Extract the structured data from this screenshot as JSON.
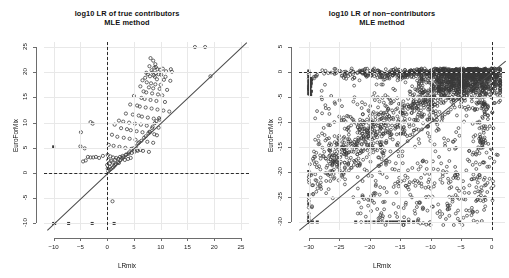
{
  "figure": {
    "background": "#ffffff",
    "point_color": "#3a3a3a",
    "line_color": "#4a4a4a",
    "ref_color": "#2b2b2b"
  },
  "panels": [
    {
      "id": "true-contributors",
      "title_line1": "log10 LR of true contributors",
      "title_line2": "MLE method",
      "xlabel": "LRmix",
      "ylabel": "EuroForMix",
      "xticks": [
        -10,
        -5,
        0,
        5,
        10,
        15,
        20,
        25
      ],
      "yticks": [
        -10,
        -5,
        0,
        5,
        10,
        15,
        20,
        25
      ],
      "xlim": [
        -11.8,
        26.5
      ],
      "ylim": [
        -11.3,
        26.0
      ],
      "hline": 0,
      "vline": 0,
      "identity_line": true
    },
    {
      "id": "non-contributors",
      "title_line1": "log10 LR of non−contributors",
      "title_line2": "MLE method",
      "xlabel": "LRmix",
      "ylabel": "EuroForMix",
      "xticks": [
        -30,
        -25,
        -20,
        -15,
        -10,
        -5,
        0
      ],
      "yticks": [
        -30,
        -25,
        -20,
        -15,
        -10,
        -5,
        0,
        5
      ],
      "xlim": [
        -31.6,
        2.2
      ],
      "ylim": [
        -31.6,
        6.0
      ],
      "hline": 0,
      "vline": 0,
      "identity_line": true
    }
  ],
  "chart_data": [
    {
      "type": "scatter",
      "title": "log10 LR of true contributors\nMLE method",
      "xlabel": "LRmix",
      "ylabel": "EuroForMix",
      "xlim": [
        -11.8,
        26.5
      ],
      "ylim": [
        -11.3,
        26.0
      ],
      "xticks": [
        -10,
        -5,
        0,
        5,
        10,
        15,
        20,
        25
      ],
      "yticks": [
        -10,
        -5,
        0,
        5,
        10,
        15,
        20,
        25
      ],
      "grid": false,
      "legend": "none",
      "annotations": [
        {
          "kind": "hline",
          "y": 0,
          "style": "dashed"
        },
        {
          "kind": "vline",
          "x": 0,
          "style": "dashed"
        },
        {
          "kind": "abline",
          "slope": 1,
          "intercept": 0,
          "style": "solid"
        }
      ],
      "marker": "open-circle",
      "censored_marker": "filled-square",
      "points": [
        [
          16.4,
          25.0
        ],
        [
          18.3,
          25.0
        ],
        [
          19.3,
          19.2
        ],
        [
          8.1,
          22.8
        ],
        [
          8.6,
          22.3
        ],
        [
          9.0,
          21.6
        ],
        [
          7.9,
          21.2
        ],
        [
          8.8,
          20.9
        ],
        [
          9.4,
          20.6
        ],
        [
          8.3,
          20.4
        ],
        [
          9.9,
          20.5
        ],
        [
          10.4,
          20.7
        ],
        [
          11.9,
          20.6
        ],
        [
          12.1,
          20.1
        ],
        [
          11.0,
          20.2
        ],
        [
          8.5,
          20.0
        ],
        [
          9.1,
          19.8
        ],
        [
          9.6,
          19.6
        ],
        [
          10.1,
          19.5
        ],
        [
          7.6,
          19.6
        ],
        [
          8.0,
          19.2
        ],
        [
          8.9,
          19.1
        ],
        [
          7.1,
          18.9
        ],
        [
          9.3,
          18.6
        ],
        [
          10.6,
          18.5
        ],
        [
          11.8,
          18.3
        ],
        [
          6.6,
          18.4
        ],
        [
          7.4,
          18.0
        ],
        [
          8.2,
          17.8
        ],
        [
          9.0,
          17.6
        ],
        [
          10.0,
          17.5
        ],
        [
          6.2,
          17.2
        ],
        [
          7.8,
          17.0
        ],
        [
          8.6,
          16.8
        ],
        [
          9.8,
          16.7
        ],
        [
          11.2,
          16.5
        ],
        [
          6.8,
          16.2
        ],
        [
          7.3,
          16.0
        ],
        [
          8.4,
          15.8
        ],
        [
          9.5,
          15.6
        ],
        [
          10.3,
          15.4
        ],
        [
          5.0,
          15.3
        ],
        [
          6.4,
          14.9
        ],
        [
          7.0,
          14.7
        ],
        [
          8.1,
          14.5
        ],
        [
          9.2,
          14.3
        ],
        [
          10.8,
          14.1
        ],
        [
          4.3,
          13.6
        ],
        [
          5.6,
          13.4
        ],
        [
          6.1,
          13.2
        ],
        [
          7.2,
          13.0
        ],
        [
          8.3,
          12.8
        ],
        [
          9.4,
          12.6
        ],
        [
          10.5,
          12.4
        ],
        [
          11.6,
          12.2
        ],
        [
          3.5,
          11.8
        ],
        [
          4.8,
          11.6
        ],
        [
          5.9,
          11.4
        ],
        [
          6.5,
          11.2
        ],
        [
          7.6,
          11.0
        ],
        [
          8.7,
          10.8
        ],
        [
          9.8,
          10.6
        ],
        [
          2.2,
          10.4
        ],
        [
          3.0,
          10.2
        ],
        [
          4.1,
          10.0
        ],
        [
          5.2,
          9.8
        ],
        [
          6.3,
          9.6
        ],
        [
          7.4,
          9.4
        ],
        [
          8.5,
          9.2
        ],
        [
          9.6,
          9.0
        ],
        [
          -3.1,
          10.1
        ],
        [
          -2.7,
          9.8
        ],
        [
          1.4,
          9.6
        ],
        [
          2.6,
          8.9
        ],
        [
          3.7,
          8.7
        ],
        [
          4.4,
          8.5
        ],
        [
          5.5,
          8.3
        ],
        [
          6.6,
          8.1
        ],
        [
          7.7,
          7.9
        ],
        [
          8.8,
          7.7
        ],
        [
          9.3,
          7.5
        ],
        [
          -4.9,
          8.1
        ],
        [
          0.9,
          7.6
        ],
        [
          1.9,
          7.2
        ],
        [
          3.1,
          7.0
        ],
        [
          4.2,
          6.8
        ],
        [
          5.3,
          6.6
        ],
        [
          6.4,
          6.4
        ],
        [
          7.5,
          6.2
        ],
        [
          8.6,
          6.0
        ],
        [
          -5.0,
          5.3
        ],
        [
          -4.2,
          4.9
        ],
        [
          0.3,
          5.6
        ],
        [
          1.2,
          5.4
        ],
        [
          2.3,
          5.2
        ],
        [
          3.4,
          5.0
        ],
        [
          4.5,
          4.8
        ],
        [
          5.6,
          4.6
        ],
        [
          6.7,
          4.4
        ],
        [
          7.8,
          4.2
        ],
        [
          -3.6,
          3.2
        ],
        [
          -3.1,
          3.1
        ],
        [
          -2.6,
          3.1
        ],
        [
          -2.1,
          3.2
        ],
        [
          -1.5,
          3.0
        ],
        [
          -0.8,
          3.4
        ],
        [
          0.1,
          3.6
        ],
        [
          0.6,
          3.3
        ],
        [
          1.1,
          3.1
        ],
        [
          1.7,
          3.0
        ],
        [
          2.4,
          3.2
        ],
        [
          2.9,
          3.4
        ],
        [
          3.5,
          3.6
        ],
        [
          4.0,
          3.8
        ],
        [
          4.6,
          4.0
        ],
        [
          5.1,
          4.2
        ],
        [
          5.7,
          4.4
        ],
        [
          6.2,
          4.6
        ],
        [
          -4.5,
          2.3
        ],
        [
          -4.0,
          2.5
        ],
        [
          0.2,
          2.6
        ],
        [
          0.8,
          2.4
        ],
        [
          1.5,
          2.6
        ],
        [
          2.1,
          2.8
        ],
        [
          2.7,
          3.0
        ],
        [
          3.3,
          2.6
        ],
        [
          3.9,
          2.8
        ],
        [
          4.4,
          3.0
        ],
        [
          0.0,
          1.6
        ],
        [
          0.5,
          1.9
        ],
        [
          1.0,
          2.1
        ],
        [
          1.6,
          1.8
        ],
        [
          2.2,
          2.0
        ],
        [
          0.1,
          0.9
        ],
        [
          0.4,
          0.6
        ],
        [
          0.2,
          0.3
        ],
        [
          0.5,
          1.2
        ],
        [
          1.3,
          1.4
        ],
        [
          8.9,
          9.9
        ],
        [
          9.2,
          10.3
        ],
        [
          9.7,
          10.9
        ],
        [
          8.4,
          8.9
        ],
        [
          7.9,
          8.2
        ],
        [
          5.4,
          5.3
        ],
        [
          4.9,
          4.9
        ],
        [
          4.1,
          4.1
        ],
        [
          3.6,
          3.7
        ],
        [
          3.0,
          3.1
        ],
        [
          2.5,
          2.6
        ],
        [
          2.0,
          2.1
        ],
        [
          1.5,
          1.6
        ],
        [
          1.1,
          1.1
        ],
        [
          0.7,
          0.8
        ],
        [
          6.9,
          7.0
        ],
        [
          6.0,
          6.1
        ],
        [
          5.8,
          5.9
        ],
        [
          7.2,
          7.3
        ],
        [
          8.0,
          8.1
        ],
        [
          1.0,
          -5.6
        ],
        [
          7.3,
          19.9
        ],
        [
          8.7,
          19.4
        ],
        [
          9.1,
          21.0
        ],
        [
          10.9,
          19.1
        ]
      ],
      "censored_points": [
        [
          -10.0,
          -10.0
        ],
        [
          -7.2,
          -10.0
        ],
        [
          -2.8,
          -10.0
        ],
        [
          1.3,
          -10.0
        ],
        [
          -10.0,
          5.2
        ],
        [
          -9.8,
          -10.0
        ]
      ]
    },
    {
      "type": "scatter",
      "title": "log10 LR of non−contributors\nMLE method",
      "xlabel": "LRmix",
      "ylabel": "EuroForMix",
      "xlim": [
        -31.6,
        2.2
      ],
      "ylim": [
        -31.6,
        6.0
      ],
      "xticks": [
        -30,
        -25,
        -20,
        -15,
        -10,
        -5,
        0
      ],
      "yticks": [
        -30,
        -25,
        -20,
        -15,
        -10,
        -5,
        0,
        5
      ],
      "grid": false,
      "legend": "none",
      "annotations": [
        {
          "kind": "hline",
          "y": 0,
          "style": "dashed"
        },
        {
          "kind": "vline",
          "x": 0,
          "style": "dashed"
        },
        {
          "kind": "abline",
          "slope": 1,
          "intercept": 0,
          "style": "solid"
        }
      ],
      "marker": "open-circle",
      "censored_marker": "filled-square",
      "description": "Dense cloud of non-contributor comparisons; strong concentration along y=0 for all LRmix values, a broad diagonal band, and censored stacks at x=-30 and y=-30.",
      "cluster_summary": [
        {
          "region": "y near 0 band",
          "x_range": [
            -30,
            1
          ],
          "y_range": [
            -1.2,
            0.6
          ],
          "n": 620
        },
        {
          "region": "upper right dense blob",
          "x_range": [
            -9,
            1
          ],
          "y_range": [
            -5,
            0.5
          ],
          "n": 520
        },
        {
          "region": "diagonal band",
          "x_range": [
            -30,
            -2
          ],
          "y_range": [
            -30,
            -3
          ],
          "n": 700
        },
        {
          "region": "lower scatter",
          "x_range": [
            -22,
            -1
          ],
          "y_range": [
            -30,
            -12
          ],
          "n": 240
        }
      ],
      "censored_x_stack": -30,
      "censored_y_stack": -30
    }
  ]
}
